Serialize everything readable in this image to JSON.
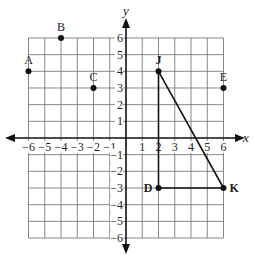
{
  "diagram": {
    "type": "coordinate-plane",
    "axes": {
      "x_label": "x",
      "y_label": "y",
      "x_range": [
        -6,
        6
      ],
      "y_range": [
        -6,
        6
      ],
      "x_ticks": [
        "−6",
        "−5",
        "−4",
        "−3",
        "−2",
        "−1",
        "1",
        "2",
        "3",
        "4",
        "5",
        "6"
      ],
      "y_ticks": [
        "6",
        "5",
        "4",
        "3",
        "2",
        "1",
        "−1",
        "−2",
        "−3",
        "−4",
        "−5",
        "−6"
      ]
    },
    "points": [
      {
        "label": "A",
        "x": -6,
        "y": 4,
        "label_pos": "above",
        "bold": false
      },
      {
        "label": "B",
        "x": -4,
        "y": 6,
        "label_pos": "above",
        "bold": false
      },
      {
        "label": "C",
        "x": -2,
        "y": 3,
        "label_pos": "above",
        "bold": false
      },
      {
        "label": "J",
        "x": 2,
        "y": 4,
        "label_pos": "above",
        "bold": true
      },
      {
        "label": "E",
        "x": 6,
        "y": 3,
        "label_pos": "above",
        "bold": false
      },
      {
        "label": "D",
        "x": 2,
        "y": -3,
        "label_pos": "left",
        "bold": true
      },
      {
        "label": "K",
        "x": 6,
        "y": -3,
        "label_pos": "right",
        "bold": true
      }
    ],
    "segments": [
      {
        "from": "J",
        "to": "D"
      },
      {
        "from": "D",
        "to": "K"
      },
      {
        "from": "J",
        "to": "K"
      }
    ],
    "colors": {
      "grid": "#6a6a6a",
      "axis": "#111111",
      "point": "#111111",
      "segment": "#111111"
    }
  }
}
